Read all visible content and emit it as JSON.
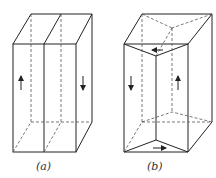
{
  "figure": {
    "panels": [
      {
        "id": "a",
        "label": "(a)",
        "description": "Rectangular prism split into two vertical halves with opposite arrows (up on left, down on right)"
      },
      {
        "id": "b",
        "label": "(b)",
        "description": "Rectangular prism split by a twisted/triangular internal surface with circulating arrows (down left, up right, left on top, right on bottom)"
      }
    ]
  }
}
